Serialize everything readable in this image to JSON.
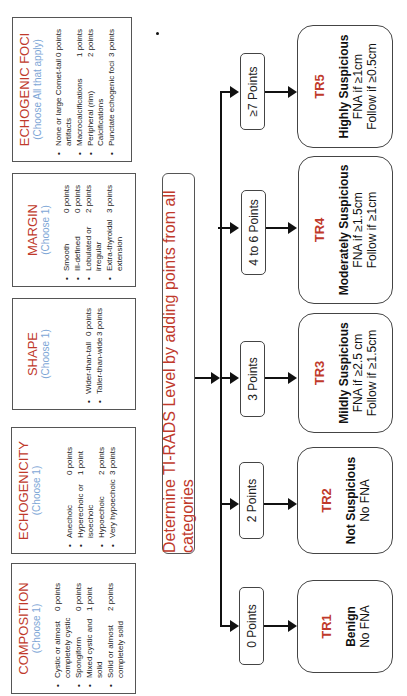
{
  "categories": [
    {
      "title": "COMPOSITION",
      "subtitle": "(Choose 1)",
      "items": [
        {
          "label": "Cystic or almost completely cystic",
          "points": "0 points"
        },
        {
          "label": "Spongiform",
          "points": "0 points"
        },
        {
          "label": "Mixed cystic and solid",
          "points": "1 point"
        },
        {
          "label": "Solid or almost completely solid",
          "points": "2 points"
        }
      ]
    },
    {
      "title": "ECHOGENICITY",
      "subtitle": "(Choose 1)",
      "items": [
        {
          "label": "Anechoic",
          "points": "0 points"
        },
        {
          "label": "Hyperechoic or isoechoic",
          "points": "1 point"
        },
        {
          "label": "Hypoechoic",
          "points": "2 points"
        },
        {
          "label": "Very hypoechoic",
          "points": "3 points"
        }
      ]
    },
    {
      "title": "SHAPE",
      "subtitle": "(Choose 1)",
      "items": [
        {
          "label": "Wider-than-tall",
          "points": "0 points"
        },
        {
          "label": "Taller-than-wide",
          "points": "3 points"
        }
      ]
    },
    {
      "title": "MARGIN",
      "subtitle": "(Choose 1)",
      "items": [
        {
          "label": "Smooth",
          "points": "0 points"
        },
        {
          "label": "Ill-defined",
          "points": "0 points"
        },
        {
          "label": "Lobulated or irregular",
          "points": "2 points"
        },
        {
          "label": "Extra-thyroidal extension",
          "points": "3 points"
        }
      ]
    },
    {
      "title": "ECHOGENIC FOCI",
      "subtitle": "(Choose All that apply)",
      "items": [
        {
          "label": "None or large Comet-tail artifacts",
          "points": "0 points"
        },
        {
          "label": "Macrocalcifications",
          "points": "1 points"
        },
        {
          "label": "Peripheral (rim) Calcifications",
          "points": "2 points"
        },
        {
          "label": "Punctate echogenic foci",
          "points": "3 points"
        }
      ]
    }
  ],
  "main_box": {
    "text": "Determine TI-RADS Level by adding points from all categories"
  },
  "point_ranges": [
    {
      "label": "0 Points"
    },
    {
      "label": "2 Points"
    },
    {
      "label": "3 Points"
    },
    {
      "label": "4 to 6 Points"
    },
    {
      "label": "≥7 Points"
    }
  ],
  "levels": [
    {
      "code": "TR1",
      "risk": "Benign",
      "lines": [
        "No FNA"
      ]
    },
    {
      "code": "TR2",
      "risk": "Not Suspicious",
      "lines": [
        "No FNA"
      ]
    },
    {
      "code": "TR3",
      "risk": "Mildly Suspicious",
      "lines": [
        "FNA if ≥2.5 cm",
        "Follow if ≥1.5cm"
      ]
    },
    {
      "code": "TR4",
      "risk": "Moderately Suspicious",
      "lines": [
        "FNA if ≥1.5cm",
        "Follow if ≥1cm"
      ]
    },
    {
      "code": "TR5",
      "risk": "Highly Suspicious",
      "lines": [
        "FNA if ≥1cm",
        "Follow if ≥0.5cm"
      ]
    }
  ],
  "colors": {
    "title_red": "#c0392b",
    "subtitle_blue": "#7ea6d6"
  }
}
